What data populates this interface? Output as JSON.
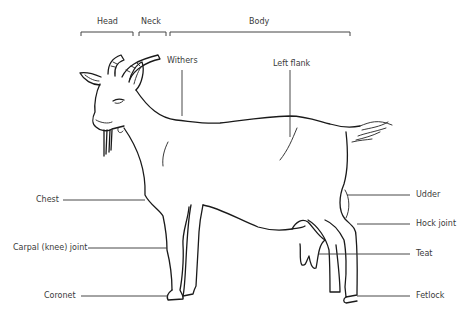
{
  "diagram": {
    "regions": [
      {
        "label": "Head"
      },
      {
        "label": "Neck"
      },
      {
        "label": "Body"
      }
    ],
    "labels": {
      "withers": "Withers",
      "left_flank": "Left flank",
      "chest": "Chest",
      "carpal": "Carpal (knee) joint",
      "coronet": "Coronet",
      "udder": "Udder",
      "hock": "Hock joint",
      "teat": "Teat",
      "fetlock": "Fetlock"
    },
    "colors": {
      "line": "#1a1a1a",
      "text": "#3a3a3a",
      "background": "#ffffff"
    }
  }
}
